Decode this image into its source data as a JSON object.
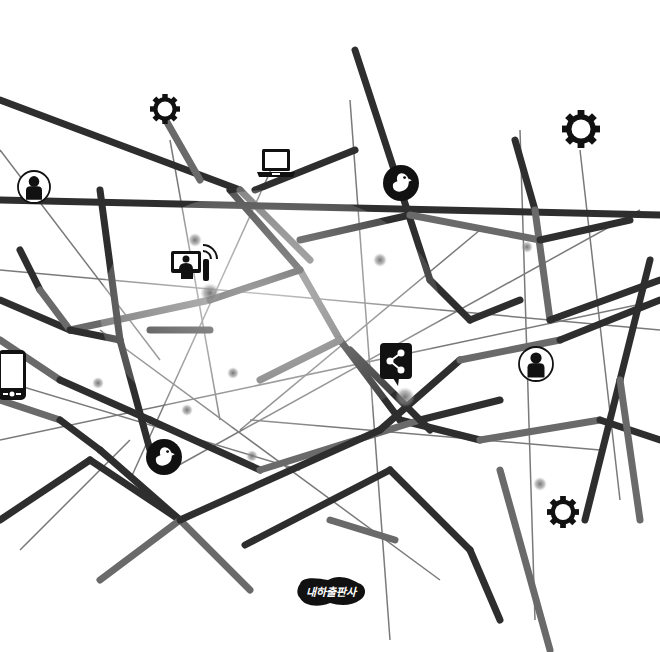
{
  "illustration": {
    "title": "Social network web illustration",
    "colors": {
      "background": "#ffffff",
      "thick_strand": "#2e2e2e",
      "thick_strand_light": "#6a6a6a",
      "thin_line": "#7a7a7a",
      "icon": "#111111",
      "glow_node": "#8a8a8a"
    },
    "thick_strands": [
      [
        0,
        100,
        240,
        190
      ],
      [
        240,
        190,
        310,
        260
      ],
      [
        0,
        200,
        660,
        215
      ],
      [
        355,
        50,
        430,
        280
      ],
      [
        160,
        110,
        200,
        180
      ],
      [
        255,
        190,
        355,
        150
      ],
      [
        515,
        140,
        535,
        210
      ],
      [
        535,
        210,
        550,
        320
      ],
      [
        550,
        320,
        660,
        280
      ],
      [
        300,
        240,
        410,
        215
      ],
      [
        410,
        215,
        540,
        240
      ],
      [
        540,
        240,
        630,
        220
      ],
      [
        230,
        190,
        300,
        270
      ],
      [
        300,
        270,
        340,
        340
      ],
      [
        340,
        340,
        400,
        420
      ],
      [
        400,
        420,
        480,
        440
      ],
      [
        480,
        440,
        600,
        420
      ],
      [
        600,
        420,
        660,
        440
      ],
      [
        0,
        300,
        70,
        330
      ],
      [
        70,
        330,
        210,
        300
      ],
      [
        210,
        300,
        300,
        270
      ],
      [
        20,
        250,
        40,
        290
      ],
      [
        40,
        290,
        70,
        330
      ],
      [
        100,
        190,
        120,
        340
      ],
      [
        120,
        340,
        150,
        450
      ],
      [
        0,
        340,
        60,
        380
      ],
      [
        60,
        380,
        150,
        420
      ],
      [
        150,
        420,
        260,
        470
      ],
      [
        260,
        470,
        420,
        420
      ],
      [
        420,
        420,
        500,
        400
      ],
      [
        70,
        330,
        120,
        340
      ],
      [
        0,
        400,
        60,
        420
      ],
      [
        60,
        420,
        100,
        450
      ],
      [
        100,
        450,
        180,
        520
      ],
      [
        180,
        520,
        250,
        590
      ],
      [
        0,
        520,
        90,
        460
      ],
      [
        90,
        460,
        180,
        520
      ],
      [
        180,
        520,
        100,
        580
      ],
      [
        180,
        520,
        380,
        430
      ],
      [
        380,
        430,
        460,
        360
      ],
      [
        460,
        360,
        560,
        340
      ],
      [
        560,
        340,
        660,
        300
      ],
      [
        245,
        545,
        390,
        470
      ],
      [
        330,
        520,
        395,
        540
      ],
      [
        390,
        470,
        470,
        550
      ],
      [
        470,
        550,
        500,
        620
      ],
      [
        500,
        470,
        550,
        650
      ],
      [
        585,
        520,
        620,
        380
      ],
      [
        620,
        380,
        650,
        260
      ],
      [
        620,
        380,
        640,
        520
      ],
      [
        150,
        330,
        210,
        330
      ],
      [
        350,
        350,
        430,
        430
      ],
      [
        260,
        380,
        340,
        340
      ],
      [
        430,
        280,
        470,
        320
      ],
      [
        470,
        320,
        520,
        300
      ]
    ],
    "thin_lines": [
      [
        0,
        150,
        160,
        360
      ],
      [
        0,
        270,
        660,
        330
      ],
      [
        170,
        140,
        220,
        420
      ],
      [
        280,
        150,
        130,
        480
      ],
      [
        350,
        100,
        390,
        640
      ],
      [
        520,
        130,
        535,
        620
      ],
      [
        580,
        150,
        620,
        500
      ],
      [
        240,
        430,
        480,
        230
      ],
      [
        0,
        440,
        660,
        300
      ],
      [
        20,
        550,
        130,
        440
      ],
      [
        170,
        470,
        640,
        210
      ],
      [
        0,
        380,
        300,
        470
      ],
      [
        100,
        330,
        440,
        580
      ],
      [
        250,
        420,
        600,
        450
      ]
    ],
    "glow_nodes": [
      {
        "x": 195,
        "y": 240,
        "r": 7
      },
      {
        "x": 210,
        "y": 293,
        "r": 10
      },
      {
        "x": 380,
        "y": 260,
        "r": 7
      },
      {
        "x": 527,
        "y": 247,
        "r": 6
      },
      {
        "x": 98,
        "y": 383,
        "r": 6
      },
      {
        "x": 233,
        "y": 373,
        "r": 6
      },
      {
        "x": 187,
        "y": 410,
        "r": 6
      },
      {
        "x": 252,
        "y": 456,
        "r": 6
      },
      {
        "x": 405,
        "y": 397,
        "r": 10
      },
      {
        "x": 540,
        "y": 484,
        "r": 7
      }
    ],
    "icons": [
      {
        "name": "gear-icon",
        "type": "gear",
        "x": 165,
        "y": 109,
        "r": 15
      },
      {
        "name": "laptop-icon",
        "type": "laptop",
        "x": 276,
        "y": 170
      },
      {
        "name": "bird-icon",
        "type": "bird",
        "x": 401,
        "y": 183,
        "r": 18
      },
      {
        "name": "gear-icon",
        "type": "gear",
        "x": 581,
        "y": 129,
        "r": 19
      },
      {
        "name": "user-circle-icon",
        "type": "user",
        "x": 34,
        "y": 187,
        "r": 16
      },
      {
        "name": "video-call-icon",
        "type": "video",
        "x": 193,
        "y": 265
      },
      {
        "name": "share-icon",
        "type": "share",
        "x": 396,
        "y": 364
      },
      {
        "name": "user-circle-icon",
        "type": "user",
        "x": 536,
        "y": 364,
        "r": 17
      },
      {
        "name": "smartphone-icon",
        "type": "phone",
        "x": 14,
        "y": 374
      },
      {
        "name": "bird-icon",
        "type": "bird",
        "x": 164,
        "y": 457,
        "r": 18
      },
      {
        "name": "gear-icon",
        "type": "gear",
        "x": 563,
        "y": 512,
        "r": 16
      }
    ],
    "logo": {
      "text": "내하출판사",
      "x": 331,
      "y": 592
    }
  }
}
